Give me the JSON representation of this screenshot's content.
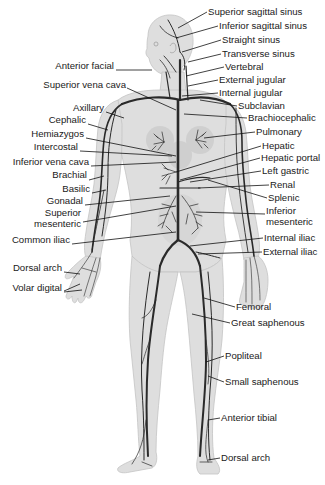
{
  "diagram": {
    "colors": {
      "skin": "#dcdcdc",
      "skin_outline": "#bdbdbd",
      "vein": "#2a2a2a",
      "leader": "#111111",
      "text": "#1a1a1a",
      "background": "#ffffff"
    },
    "labels_right": [
      {
        "id": "superior-sagittal-sinus",
        "text": "Superior sagittal sinus",
        "x": 208,
        "y": 11
      },
      {
        "id": "inferior-sagittal-sinus",
        "text": "Inferior sagittal sinus",
        "x": 219,
        "y": 25
      },
      {
        "id": "straight-sinus",
        "text": "Straight sinus",
        "x": 222,
        "y": 39
      },
      {
        "id": "transverse-sinus",
        "text": "Transverse sinus",
        "x": 222,
        "y": 53
      },
      {
        "id": "vertebral",
        "text": "Vertebral",
        "x": 225,
        "y": 66
      },
      {
        "id": "external-jugular",
        "text": "External jugular",
        "x": 219,
        "y": 79
      },
      {
        "id": "internal-jugular",
        "text": "Internal jugular",
        "x": 219,
        "y": 92
      },
      {
        "id": "subclavian",
        "text": "Subclavian",
        "x": 238,
        "y": 105
      },
      {
        "id": "brachiocephalic",
        "text": "Brachiocephalic",
        "x": 248,
        "y": 117
      },
      {
        "id": "pulmonary",
        "text": "Pulmonary",
        "x": 256,
        "y": 131
      },
      {
        "id": "hepatic",
        "text": "Hepatic",
        "x": 262,
        "y": 145
      },
      {
        "id": "hepatic-portal",
        "text": "Hepatic portal",
        "x": 261,
        "y": 157
      },
      {
        "id": "left-gastric",
        "text": "Left gastric",
        "x": 262,
        "y": 170
      },
      {
        "id": "renal",
        "text": "Renal",
        "x": 270,
        "y": 184
      },
      {
        "id": "splenic",
        "text": "Splenic",
        "x": 268,
        "y": 197
      },
      {
        "id": "inferior-mesenteric",
        "text": "Inferior\nmesenteric",
        "x": 266,
        "y": 209
      },
      {
        "id": "internal-iliac",
        "text": "Internal iliac",
        "x": 264,
        "y": 237
      },
      {
        "id": "external-iliac",
        "text": "External iliac",
        "x": 263,
        "y": 251
      },
      {
        "id": "femoral",
        "text": "Femoral",
        "x": 236,
        "y": 306
      },
      {
        "id": "great-saphenous",
        "text": "Great saphenous",
        "x": 231,
        "y": 322
      },
      {
        "id": "popliteal",
        "text": "Popliteal",
        "x": 225,
        "y": 355
      },
      {
        "id": "small-saphenous",
        "text": "Small saphenous",
        "x": 225,
        "y": 381
      },
      {
        "id": "anterior-tibial",
        "text": "Anterior tibial",
        "x": 221,
        "y": 417
      },
      {
        "id": "dorsal-arch-foot",
        "text": "Dorsal arch",
        "x": 221,
        "y": 457
      }
    ],
    "labels_left": [
      {
        "id": "anterior-facial",
        "text": "Anterior facial",
        "right": 114,
        "y": 65
      },
      {
        "id": "superior-vena-cava",
        "text": "Superior vena cava",
        "right": 126,
        "y": 84
      },
      {
        "id": "axillary",
        "text": "Axillary",
        "right": 104,
        "y": 107
      },
      {
        "id": "cephalic",
        "text": "Cephalic",
        "right": 86,
        "y": 119
      },
      {
        "id": "hemiazygos",
        "text": "Hemiazygos",
        "right": 84,
        "y": 133
      },
      {
        "id": "intercostal",
        "text": "Intercostal",
        "right": 78,
        "y": 146
      },
      {
        "id": "inferior-vena-cava",
        "text": "Inferior vena cava",
        "right": 89,
        "y": 161
      },
      {
        "id": "brachial",
        "text": "Brachial",
        "right": 87,
        "y": 174
      },
      {
        "id": "basilic",
        "text": "Basilic",
        "right": 90,
        "y": 188
      },
      {
        "id": "gonadal",
        "text": "Gonadal",
        "right": 83,
        "y": 200
      },
      {
        "id": "superior-mesenteric",
        "text": "Superior\nmesenteric",
        "right": 81,
        "y": 212
      },
      {
        "id": "common-iliac",
        "text": "Common iliac",
        "right": 70,
        "y": 239
      },
      {
        "id": "dorsal-arch-hand",
        "text": "Dorsal arch",
        "right": 62,
        "y": 267
      },
      {
        "id": "volar-digital",
        "text": "Volar digital",
        "right": 62,
        "y": 287
      }
    ]
  }
}
